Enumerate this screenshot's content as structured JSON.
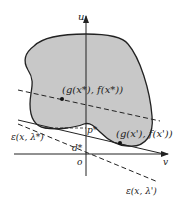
{
  "diagram": {
    "type": "geometric-interpretation-lagrangian-dual",
    "axes": {
      "vertical_label": "u",
      "horizontal_label": "v",
      "origin_label": "o"
    },
    "region": {
      "fill": "#c8c8c8",
      "stroke": "#222222"
    },
    "points": [
      {
        "id": "x_star",
        "label": "(g(x*), f(x*))"
      },
      {
        "id": "x_prime",
        "label": "(g(x'), f(x'))"
      }
    ],
    "lines": [
      {
        "id": "eps_lambda_star",
        "label": "ε(x, λ*)",
        "style": "solid"
      },
      {
        "id": "eps_lambda_prime",
        "label": "ε(x, λ')",
        "style": "dashed"
      },
      {
        "id": "through_x_star",
        "label": "",
        "style": "dashed"
      }
    ],
    "markers": {
      "p_label": "p*",
      "d_label": "d*"
    }
  }
}
